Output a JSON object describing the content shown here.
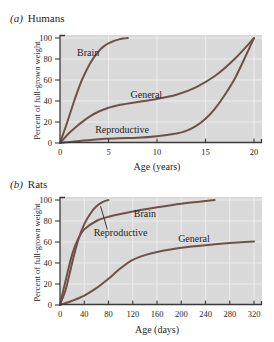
{
  "figure": {
    "colors": {
      "curve": "#6e5249",
      "plot_bg": "#d9d9d9",
      "grid": "#ececec",
      "axis": "#3a3a3a",
      "text": "#262626",
      "page_bg": "#ffffff"
    },
    "panels": [
      {
        "label": "(a)",
        "title": "Humans"
      },
      {
        "label": "(b)",
        "title": "Rats"
      }
    ]
  },
  "chart_data": [
    {
      "type": "line",
      "title": "(a) Humans",
      "xlabel": "Age (years)",
      "ylabel": "Percent of full-grown weight",
      "xlim": [
        0,
        20
      ],
      "ylim": [
        0,
        100
      ],
      "xticks": [
        0,
        5,
        10,
        15,
        20
      ],
      "yticks": [
        0,
        20,
        40,
        60,
        80,
        100
      ],
      "grid": true,
      "legend_position": "inline-labels",
      "series": [
        {
          "name": "Brain",
          "x": [
            0,
            0.5,
            1,
            1.5,
            2,
            2.5,
            3,
            3.5,
            4,
            4.5,
            5,
            5.5,
            6,
            6.5,
            7
          ],
          "y": [
            0,
            13,
            27,
            41,
            54,
            65,
            74,
            81.5,
            87.5,
            92,
            95,
            97,
            98.5,
            99.4,
            100
          ]
        },
        {
          "name": "General",
          "x": [
            0,
            1,
            2,
            3,
            4,
            5,
            6,
            8,
            10,
            12,
            14,
            16,
            18,
            20
          ],
          "y": [
            0,
            10,
            18,
            25,
            30,
            33.5,
            36,
            39,
            42,
            46,
            53,
            64,
            80,
            100
          ]
        },
        {
          "name": "Reproductive",
          "x": [
            0,
            2,
            4,
            6,
            8,
            10,
            12,
            13,
            14,
            15,
            16,
            17,
            18,
            19,
            20
          ],
          "y": [
            0,
            2,
            3.5,
            4.5,
            5,
            6.5,
            9,
            11.5,
            16,
            23,
            33,
            46,
            61,
            80,
            100
          ]
        }
      ],
      "labels": [
        {
          "text": "Brain",
          "x": 2.9,
          "y": 86
        },
        {
          "text": "General",
          "x": 8.9,
          "y": 46
        },
        {
          "text": "Reproductive",
          "x": 6.4,
          "y": 12
        }
      ],
      "annotations": []
    },
    {
      "type": "line",
      "title": "(b) Rats",
      "xlabel": "Age (days)",
      "ylabel": "Percent of full-grown weight",
      "xlim": [
        0,
        320
      ],
      "ylim": [
        0,
        100
      ],
      "xticks": [
        0,
        40,
        80,
        120,
        160,
        200,
        240,
        280,
        320
      ],
      "yticks": [
        0,
        20,
        40,
        60,
        80,
        100
      ],
      "grid": true,
      "legend_position": "inline-labels",
      "series": [
        {
          "name": "Brain",
          "x": [
            0,
            10,
            20,
            30,
            40,
            60,
            80,
            120,
            160,
            200,
            240,
            255
          ],
          "y": [
            0,
            25,
            48,
            63,
            72,
            80,
            84,
            89,
            93,
            96.5,
            99,
            100
          ]
        },
        {
          "name": "Reproductive",
          "x": [
            0,
            10,
            20,
            30,
            40,
            50,
            60,
            70,
            80
          ],
          "y": [
            0,
            16,
            40,
            62,
            77,
            87,
            94,
            98,
            100
          ]
        },
        {
          "name": "General",
          "x": [
            0,
            20,
            40,
            60,
            80,
            100,
            120,
            140,
            160,
            200,
            240,
            280,
            320
          ],
          "y": [
            0,
            4,
            9,
            16,
            25,
            35,
            43,
            47.5,
            50.5,
            54.5,
            57,
            59,
            60.5
          ]
        }
      ],
      "labels": [
        {
          "text": "Brain",
          "x": 140,
          "y": 87
        },
        {
          "text": "Reproductive",
          "x": 100,
          "y": 69
        },
        {
          "text": "General",
          "x": 221,
          "y": 63
        }
      ],
      "annotations": [
        {
          "type": "leader-line",
          "x1": 78,
          "y1": 72,
          "x2": 67,
          "y2": 94
        }
      ]
    }
  ]
}
